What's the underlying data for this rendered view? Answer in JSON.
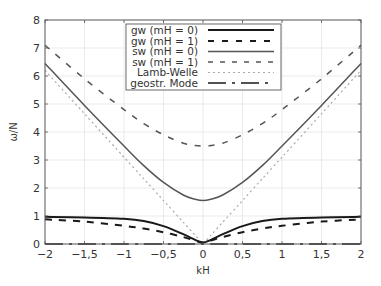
{
  "chart_data": {
    "type": "line",
    "title": "",
    "xlabel": "kH",
    "ylabel": "ω/N",
    "xlim": [
      -2,
      2
    ],
    "ylim": [
      0,
      8
    ],
    "grid": true,
    "legend_position": "upper center",
    "x_ticks": [
      "−2",
      "−1,5",
      "−1",
      "−0,5",
      "0",
      "0,5",
      "1",
      "1,5",
      "2"
    ],
    "x_tick_values": [
      -2,
      -1.5,
      -1,
      -0.5,
      0,
      0.5,
      1,
      1.5,
      2
    ],
    "y_ticks": [
      "0",
      "1",
      "2",
      "3",
      "4",
      "5",
      "6",
      "7",
      "8"
    ],
    "y_tick_values": [
      0,
      1,
      2,
      3,
      4,
      5,
      6,
      7,
      8
    ],
    "x": [
      -2,
      -1.5,
      -1,
      -0.75,
      -0.5,
      -0.25,
      -0.1,
      0,
      0.1,
      0.25,
      0.5,
      0.75,
      1,
      1.5,
      2
    ],
    "series": [
      {
        "name": "gw (mH = 0)",
        "style": "solid-thick",
        "color": "#1a1a1a",
        "values": [
          0.97,
          0.95,
          0.9,
          0.82,
          0.64,
          0.35,
          0.15,
          0.05,
          0.15,
          0.35,
          0.64,
          0.82,
          0.9,
          0.95,
          0.97
        ]
      },
      {
        "name": "gw (mH = 1)",
        "style": "dashed-thick",
        "color": "#1a1a1a",
        "values": [
          0.88,
          0.8,
          0.65,
          0.55,
          0.42,
          0.25,
          0.12,
          0.05,
          0.12,
          0.25,
          0.42,
          0.55,
          0.65,
          0.8,
          0.88
        ]
      },
      {
        "name": "sw (mH = 0)",
        "style": "solid",
        "color": "#555555",
        "values": [
          6.45,
          4.95,
          3.5,
          2.8,
          2.2,
          1.75,
          1.6,
          1.55,
          1.6,
          1.75,
          2.2,
          2.8,
          3.5,
          4.95,
          6.45
        ]
      },
      {
        "name": "sw (mH = 1)",
        "style": "dashed",
        "color": "#555555",
        "values": [
          7.1,
          5.9,
          4.8,
          4.3,
          3.9,
          3.6,
          3.52,
          3.5,
          3.52,
          3.6,
          3.9,
          4.3,
          4.8,
          5.9,
          7.1
        ]
      },
      {
        "name": "Lamb-Welle",
        "style": "dotted",
        "color": "#aaaaaa",
        "values": [
          6.2,
          4.65,
          3.1,
          2.33,
          1.55,
          0.78,
          0.31,
          0,
          0.31,
          0.78,
          1.55,
          2.33,
          3.1,
          4.65,
          6.2
        ]
      },
      {
        "name": "geostr. Mode",
        "style": "dash-dot",
        "color": "#1a1a1a",
        "values": [
          0,
          0,
          0,
          0,
          0,
          0,
          0,
          0,
          0,
          0,
          0,
          0,
          0,
          0,
          0
        ]
      }
    ]
  },
  "axes": {
    "xlabel": "kH",
    "ylabel": "ω/N"
  },
  "legend": [
    {
      "label": "gw (mH = 0)"
    },
    {
      "label": "gw (mH = 1)"
    },
    {
      "label": "sw (mH = 0)"
    },
    {
      "label": "sw (mH = 1)"
    },
    {
      "label": "Lamb-Welle"
    },
    {
      "label": "geostr. Mode"
    }
  ],
  "ticks": {
    "x": [
      "−2",
      "−1,5",
      "−1",
      "−0,5",
      "0",
      "0,5",
      "1",
      "1,5",
      "2"
    ],
    "y": [
      "0",
      "1",
      "2",
      "3",
      "4",
      "5",
      "6",
      "7",
      "8"
    ]
  }
}
